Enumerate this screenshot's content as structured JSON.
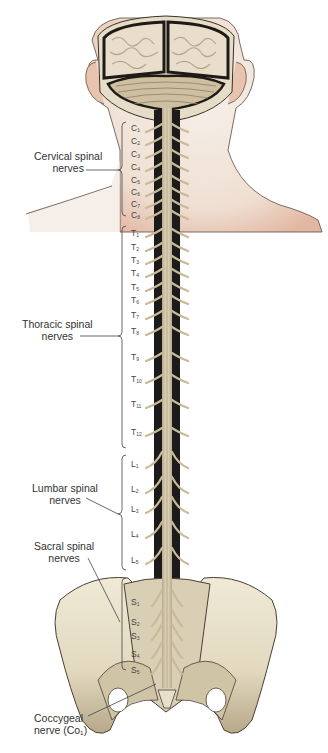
{
  "figure": {
    "colors": {
      "background": "#ffffff",
      "skin": "#f1e6dc",
      "skin_shadow": "#e3b9a4",
      "bone": "#e9e2cc",
      "bone_shadow": "#a89a7e",
      "nerve": "#cdbf9f",
      "canal": "#1b1b1b",
      "brain": "#e8dcc8",
      "label_text": "#333333"
    }
  },
  "groups": [
    {
      "id": "cervical",
      "line1": "Cervical spinal",
      "line2": "nerves"
    },
    {
      "id": "thoracic",
      "line1": "Thoracic spinal",
      "line2": "nerves"
    },
    {
      "id": "lumbar",
      "line1": "Lumbar spinal",
      "line2": "nerves"
    },
    {
      "id": "sacral",
      "line1": "Sacral spinal",
      "line2": "nerves"
    },
    {
      "id": "coccygeal",
      "line1": "Coccygeal",
      "line2": "nerve (Co₁)"
    }
  ],
  "segments": {
    "cervical": [
      {
        "letter": "C",
        "num": "1"
      },
      {
        "letter": "C",
        "num": "2"
      },
      {
        "letter": "C",
        "num": "3"
      },
      {
        "letter": "C",
        "num": "4"
      },
      {
        "letter": "C",
        "num": "5"
      },
      {
        "letter": "C",
        "num": "6"
      },
      {
        "letter": "C",
        "num": "7"
      },
      {
        "letter": "C",
        "num": "8"
      }
    ],
    "thoracic": [
      {
        "letter": "T",
        "num": "1"
      },
      {
        "letter": "T",
        "num": "2"
      },
      {
        "letter": "T",
        "num": "3"
      },
      {
        "letter": "T",
        "num": "4"
      },
      {
        "letter": "T",
        "num": "5"
      },
      {
        "letter": "T",
        "num": "6"
      },
      {
        "letter": "T",
        "num": "7"
      },
      {
        "letter": "T",
        "num": "8"
      },
      {
        "letter": "T",
        "num": "9"
      },
      {
        "letter": "T",
        "num": "10"
      },
      {
        "letter": "T",
        "num": "11"
      },
      {
        "letter": "T",
        "num": "12"
      }
    ],
    "lumbar": [
      {
        "letter": "L",
        "num": "1"
      },
      {
        "letter": "L",
        "num": "2"
      },
      {
        "letter": "L",
        "num": "3"
      },
      {
        "letter": "L",
        "num": "4"
      },
      {
        "letter": "L",
        "num": "5"
      }
    ],
    "sacral": [
      {
        "letter": "S",
        "num": "1"
      },
      {
        "letter": "S",
        "num": "2"
      },
      {
        "letter": "S",
        "num": "3"
      },
      {
        "letter": "S",
        "num": "4"
      },
      {
        "letter": "S",
        "num": "5"
      }
    ]
  }
}
